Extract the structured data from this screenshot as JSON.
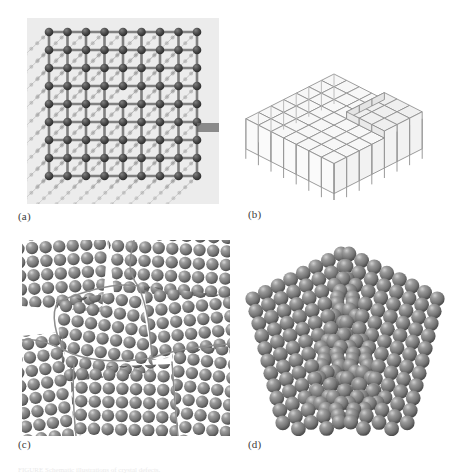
{
  "figure": {
    "kind": "four-panel-scientific-illustration",
    "background_color": "#ffffff",
    "caption_partial": "FIGURE  Schematic illustrations of crystal defects."
  },
  "panels": [
    {
      "id": "a",
      "label": "(a)",
      "title": "ball-and-stick lattice with edge dislocation",
      "plate_color": "#ececec",
      "atom_color": "#4a4a4a",
      "bond_color": "#9b9b9b",
      "rows": 9,
      "cols": 9,
      "depth": 6
    },
    {
      "id": "b",
      "label": "(b)",
      "title": "isometric cubic lattice with surface step",
      "line_color": "#8a8a8a",
      "face_color": "#f4f4f4",
      "rows": 7,
      "cols": 7
    },
    {
      "id": "c",
      "label": "(c)",
      "title": "polycrystalline grains separated by grain boundaries",
      "sphere_color": "#808080",
      "boundary_color": "#8d8d8d",
      "grain_count": 6,
      "sphere_count": 228
    },
    {
      "id": "d",
      "label": "(d)",
      "title": "twin boundary chevron of close-packed spheres",
      "sphere_color": "#7d7d7d",
      "rows": 13,
      "columns": 15
    }
  ],
  "colors": {
    "page": "#ffffff",
    "ink": "#3c3c3c",
    "sphere_base": "#808080",
    "sphere_highlight": "#d8d8d8",
    "sphere_shadow": "#4e4e4e",
    "line": "#8a8a8a",
    "plate": "#ececec"
  }
}
